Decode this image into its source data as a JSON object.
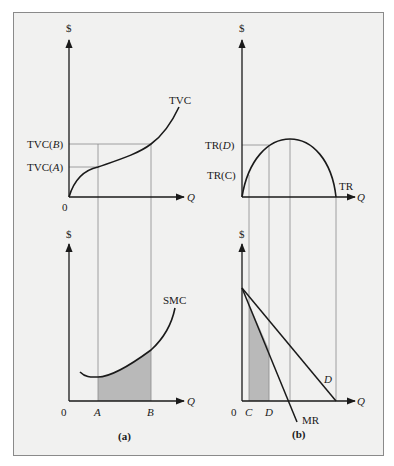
{
  "figure": {
    "panels": [
      {
        "id": "a",
        "caption": "(a)",
        "top": {
          "y_axis_label": "$",
          "x_axis_label": "Q",
          "origin_label": "0",
          "curve_label": "TVC",
          "y_tick_labels": [
            "TVC(B)",
            "TVC(A)"
          ]
        },
        "bottom": {
          "y_axis_label": "$",
          "x_axis_label": "Q",
          "origin_label": "0",
          "curve_label": "SMC",
          "x_tick_labels": [
            "A",
            "B"
          ],
          "shaded_region": "area under SMC between A and B"
        }
      },
      {
        "id": "b",
        "caption": "(b)",
        "top": {
          "y_axis_label": "$",
          "x_axis_label": "Q",
          "origin_label": "",
          "curve_label": "TR",
          "y_tick_labels": [
            "TR(D)",
            "TR(C)"
          ]
        },
        "bottom": {
          "y_axis_label": "$",
          "x_axis_label": "Q",
          "origin_label": "0",
          "curve_labels": [
            "D",
            "MR"
          ],
          "x_tick_labels": [
            "C",
            "D"
          ],
          "shaded_region": "area under MR between C and D"
        }
      }
    ],
    "colors": {
      "background": "#f1f1f0",
      "frame": "#8a8a8a",
      "line": "#1a1a1a",
      "guide": "#8c8c8c",
      "shade": "#b9b9b9"
    }
  },
  "labels": {
    "a_top_y": "$",
    "a_top_x": "Q",
    "a_top_origin": "0",
    "a_top_curve": "TVC",
    "a_top_tvcb_prefix": "TVC(",
    "a_top_tvcb_var": "B",
    "a_top_tvca_prefix": "TVC(",
    "a_top_tvca_var": "A",
    "close_paren": ")",
    "a_bot_y": "$",
    "a_bot_x": "Q",
    "a_bot_origin": "0",
    "a_bot_curve": "SMC",
    "a_bot_A": "A",
    "a_bot_B": "B",
    "a_caption": "(a)",
    "b_top_y": "$",
    "b_top_x": "Q",
    "b_top_curve": "TR",
    "b_top_trd_prefix": "TR(",
    "b_top_trd_var": "D",
    "b_top_trc": "TR(C)",
    "b_bot_y": "$",
    "b_bot_x": "Q",
    "b_bot_origin": "0",
    "b_bot_C": "C",
    "b_bot_D": "D",
    "b_bot_demand": "D",
    "b_bot_mr": "MR",
    "b_caption": "(b)"
  }
}
